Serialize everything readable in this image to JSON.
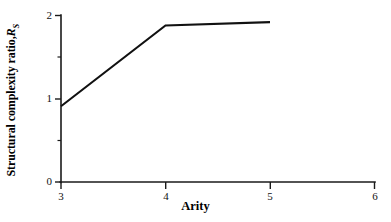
{
  "chart_data": {
    "type": "line",
    "title": "",
    "xlabel": "Arity",
    "ylabel_text": "Structural complexity ratio,",
    "ylabel_symbol": "R",
    "ylabel_subscript": "S",
    "x": [
      3,
      4,
      5
    ],
    "values": [
      0.91,
      1.88,
      1.92
    ],
    "series": [
      {
        "name": "Structural complexity ratio",
        "x": [
          3,
          4,
          5
        ],
        "values": [
          0.91,
          1.88,
          1.92
        ]
      }
    ],
    "xlim": [
      3,
      6
    ],
    "ylim": [
      0,
      2
    ],
    "x_ticks": [
      3,
      4,
      5,
      6
    ],
    "x_tick_labels": [
      "3",
      "4",
      "5",
      "6"
    ],
    "y_ticks": [
      0,
      1,
      2
    ],
    "y_tick_labels": [
      "0",
      "1",
      "2"
    ],
    "y_minor_ticks": [
      0.5,
      1.5
    ],
    "grid": false,
    "legend": false,
    "line_color": "#111111",
    "axis_color": "#1a1a1a",
    "background_color": "#ffffff"
  },
  "axis": {
    "y_labels": {
      "t0": "0",
      "t1": "1",
      "t2": "2"
    },
    "x_labels": {
      "t3": "3",
      "t4": "4",
      "t5": "5",
      "t6": "6"
    }
  },
  "labels": {
    "x_axis_title": "Arity",
    "y_axis_title_text": "Structural complexity ratio,",
    "y_axis_symbol": "R",
    "y_axis_subscript": "S"
  }
}
